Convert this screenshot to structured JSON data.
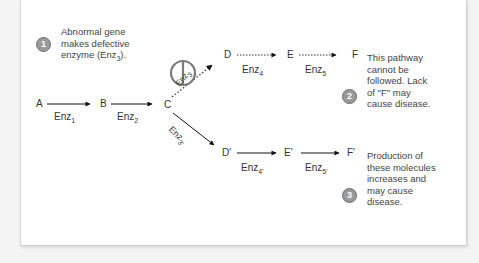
{
  "notes": {
    "n1": {
      "number": "1",
      "lines": [
        "Abnormal gene",
        "makes defective",
        "enzyme (Enz",
        "3",
        ")."
      ]
    },
    "n2": {
      "number": "2",
      "lines": [
        "This pathway",
        "cannot be",
        "followed. Lack",
        "of \"F\" may",
        "cause disease."
      ]
    },
    "n3": {
      "number": "3",
      "lines": [
        "Production of",
        "these molecules",
        "increases and",
        "may cause",
        "disease."
      ]
    }
  },
  "molecules": {
    "A": "A",
    "B": "B",
    "C": "C",
    "D": "D",
    "E": "E",
    "F": "F",
    "D2": "D'",
    "E2": "E'",
    "F2": "F'"
  },
  "enzymes": {
    "enz1": {
      "base": "Enz",
      "sub": "1"
    },
    "enz2": {
      "base": "Enz",
      "sub": "2"
    },
    "enz3": {
      "base": "Enz",
      "sub": "3"
    },
    "enz3p": {
      "base": "Enz",
      "sub": "3'"
    },
    "enz4": {
      "base": "Enz",
      "sub": "4"
    },
    "enz5": {
      "base": "Enz",
      "sub": "5"
    },
    "enz4p": {
      "base": "Enz",
      "sub": "4'"
    },
    "enz5p": {
      "base": "Enz",
      "sub": "5'"
    }
  },
  "colors": {
    "badge": "#9a9a9a",
    "text": "#333333",
    "blocked": "#777777"
  }
}
